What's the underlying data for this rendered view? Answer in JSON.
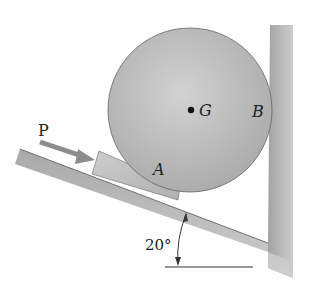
{
  "diagram": {
    "labels": {
      "force": "P",
      "center": "G",
      "contact_wedge": "A",
      "contact_wall": "B",
      "angle": "20°"
    },
    "elements": [
      "inclined plane",
      "wedge block",
      "cylinder",
      "vertical wall",
      "force arrow P",
      "angle dimension 20°"
    ],
    "colors": {
      "surface": "#b5b5b5",
      "surface_dark": "#9a9a9a",
      "cylinder": "#bdbdbd",
      "wedge": "#c4c4c4",
      "arrow": "#8c8c8c",
      "line": "#333333"
    }
  }
}
